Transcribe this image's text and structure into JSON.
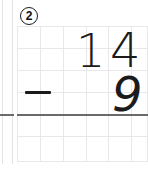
{
  "worksheet": {
    "problem_number": "2",
    "problem_type": "vertical-subtraction",
    "minuend": "14",
    "subtrahend": "9",
    "operator": "−",
    "answer": "",
    "minuend_tens": "1",
    "minuend_ones": "4",
    "subtrahend_ones": "9",
    "answer_placeholder": ""
  },
  "grid": {
    "columns": 6,
    "rows": 6,
    "cell_size_px": 22,
    "line_color": "#e8e8e8",
    "answer_rule_color": "#6a6a6a"
  },
  "colors": {
    "ink": "#1b1b1b",
    "paper": "#ffffff",
    "grid_line": "#e8e8e8",
    "rule": "#6a6a6a"
  }
}
